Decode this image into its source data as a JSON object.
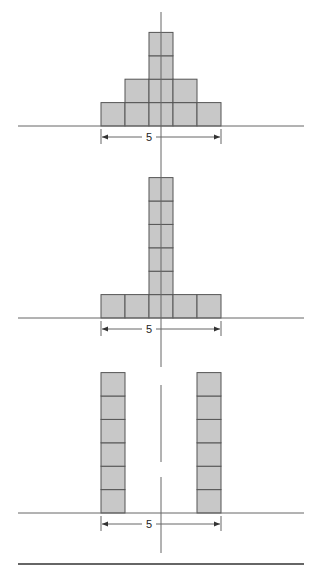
{
  "figures": [
    {
      "name": "pyramid",
      "baseline_y": 126,
      "dimension_label": "5",
      "columns": [
        {
          "x": 101,
          "blocks": 1
        },
        {
          "x": 125,
          "blocks": 2
        },
        {
          "x": 149,
          "blocks": 4
        },
        {
          "x": 173,
          "blocks": 2
        },
        {
          "x": 197,
          "blocks": 1
        }
      ]
    },
    {
      "name": "t-shape",
      "baseline_y": 318,
      "dimension_label": "5",
      "columns": [
        {
          "x": 101,
          "blocks": 1
        },
        {
          "x": 125,
          "blocks": 1
        },
        {
          "x": 149,
          "blocks": 6
        },
        {
          "x": 173,
          "blocks": 1
        },
        {
          "x": 197,
          "blocks": 1
        }
      ]
    },
    {
      "name": "two-towers",
      "baseline_y": 513,
      "dimension_label": "5",
      "columns": [
        {
          "x": 101,
          "blocks": 6
        },
        {
          "x": 197,
          "blocks": 6
        }
      ]
    }
  ],
  "colors": {
    "block_fill": "#c8c8c8",
    "block_stroke": "#555555",
    "line": "#666666"
  },
  "block_size": {
    "w": 24,
    "h": 23.4
  },
  "span": {
    "left": 101,
    "right": 221
  }
}
